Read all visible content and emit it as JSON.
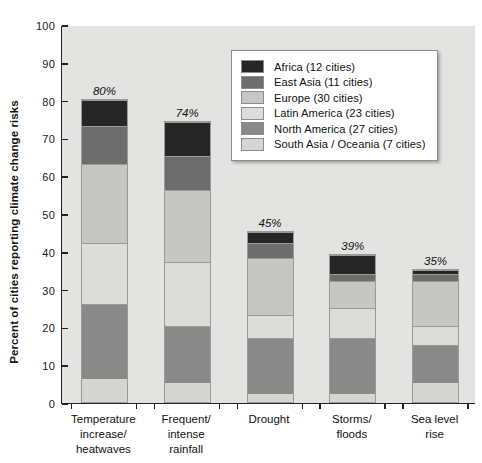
{
  "chart_data": {
    "type": "bar",
    "subtype": "stacked-bar",
    "title": "",
    "xlabel": "",
    "ylabel": "Percent of cities reporting climate change risks",
    "ylim": [
      0,
      100
    ],
    "yticks": [
      0,
      10,
      20,
      30,
      40,
      50,
      60,
      70,
      80,
      90,
      100
    ],
    "grid": false,
    "legend_position": "upper-right-inside",
    "categories": [
      "Temperature increase/ heatwaves",
      "Frequent/ intense rainfall",
      "Drought",
      "Storms/ floods",
      "Sea level rise"
    ],
    "category_lines": [
      [
        "Temperature",
        "increase/",
        "heatwaves"
      ],
      [
        "Frequent/",
        "intense",
        "rainfall"
      ],
      [
        "Drought"
      ],
      [
        "Storms/",
        "floods"
      ],
      [
        "Sea level",
        "rise"
      ]
    ],
    "totals": [
      80,
      74,
      45,
      39,
      35
    ],
    "total_labels": [
      "80%",
      "74%",
      "45%",
      "39%",
      "35%"
    ],
    "series": [
      {
        "name": "South Asia / Oceania (7 cities)",
        "short": "South Asia / Oceania",
        "cities": 7,
        "color": "#d5d5d2",
        "values": [
          6,
          5,
          2,
          2,
          5
        ]
      },
      {
        "name": "North America (27 cities)",
        "short": "North America",
        "cities": 27,
        "color": "#898989",
        "values": [
          20,
          15,
          15,
          15,
          10
        ]
      },
      {
        "name": "Latin America (23 cities)",
        "short": "Latin America",
        "cities": 23,
        "color": "#dcdcd9",
        "values": [
          16,
          17,
          6,
          8,
          5
        ]
      },
      {
        "name": "Europe (30 cities)",
        "short": "Europe",
        "cities": 30,
        "color": "#c6c6c3",
        "values": [
          21,
          19,
          15,
          7,
          12
        ]
      },
      {
        "name": "East Asia (11 cities)",
        "short": "East Asia",
        "cities": 11,
        "color": "#6d6d6d",
        "values": [
          10,
          9,
          4,
          2,
          2
        ]
      },
      {
        "name": "Africa (12 cities)",
        "short": "Africa",
        "cities": 12,
        "color": "#262626",
        "values": [
          7,
          9,
          3,
          5,
          1
        ]
      }
    ],
    "legend_entries": [
      {
        "label": "Africa (12 cities)",
        "color": "#262626"
      },
      {
        "label": "East Asia (11 cities)",
        "color": "#6d6d6d"
      },
      {
        "label": "Europe (30 cities)",
        "color": "#c6c6c3"
      },
      {
        "label": "Latin America (23 cities)",
        "color": "#dcdcd9"
      },
      {
        "label": "North America (27 cities)",
        "color": "#898989"
      },
      {
        "label": "South Asia / Oceania (7 cities)",
        "color": "#d5d5d2"
      }
    ],
    "colors": {
      "plot_background": "#e3e3e1",
      "page_background": "#ffffff",
      "axis": "#222222",
      "text": "#111111"
    }
  }
}
